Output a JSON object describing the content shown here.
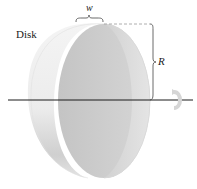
{
  "diagram": {
    "title": "Disk",
    "labels": {
      "object": "Disk",
      "width": "w",
      "radius": "R"
    },
    "elements": [
      {
        "name": "disk",
        "shape": "cylinder-disk",
        "orientation": "rotation axis horizontal"
      },
      {
        "name": "rotation-axis",
        "shape": "horizontal line"
      },
      {
        "name": "rotation-arrow",
        "shape": "curved arrow around axis"
      },
      {
        "name": "width-brace",
        "label": "w"
      },
      {
        "name": "radius-brace",
        "label": "R"
      }
    ],
    "colors": {
      "disk_face": "#c8c8c8",
      "disk_rim_light": "#f2f2f2",
      "disk_rim_shadow": "#bdbdbd",
      "axis": "#1a1a1a",
      "annotation": "#555555"
    }
  }
}
